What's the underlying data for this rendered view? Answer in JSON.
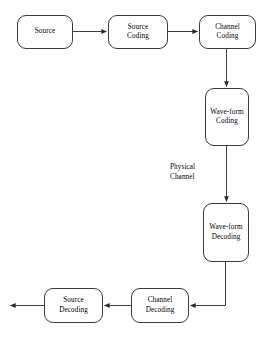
{
  "diagram": {
    "background_color": "#ffffff",
    "stroke_color": "#3a3a3a",
    "text_color": "#000000",
    "nodes": [
      {
        "id": "source",
        "lines": [
          "Source"
        ],
        "x": 17,
        "y": 15,
        "w": 56,
        "h": 34
      },
      {
        "id": "source-coding",
        "lines": [
          "Source",
          "Coding"
        ],
        "x": 108,
        "y": 15,
        "w": 60,
        "h": 34
      },
      {
        "id": "channel-coding",
        "lines": [
          "Channel",
          "Coding"
        ],
        "x": 199,
        "y": 15,
        "w": 57,
        "h": 34
      },
      {
        "id": "waveform-coding",
        "lines": [
          "Wave-form",
          "Coding"
        ],
        "x": 205,
        "y": 88,
        "w": 44,
        "h": 58
      },
      {
        "id": "waveform-decoding",
        "lines": [
          "Wave-form",
          "Decoding"
        ],
        "x": 203,
        "y": 203,
        "w": 46,
        "h": 59
      },
      {
        "id": "channel-decoding",
        "lines": [
          "Channel",
          "Decoding"
        ],
        "x": 131,
        "y": 288,
        "w": 58,
        "h": 35
      },
      {
        "id": "source-decoding",
        "lines": [
          "Source",
          "Decoding"
        ],
        "x": 44,
        "y": 288,
        "w": 59,
        "h": 35
      }
    ],
    "labels": [
      {
        "id": "physical-channel",
        "lines": [
          "Physical",
          "Channel"
        ],
        "x": 170,
        "y": 163
      }
    ],
    "connectors": [
      {
        "id": "source-to-source-coding",
        "from": "source",
        "to": "source-coding",
        "direction": "right"
      },
      {
        "id": "source-coding-to-channel-coding",
        "from": "source-coding",
        "to": "channel-coding",
        "direction": "right"
      },
      {
        "id": "channel-coding-to-waveform-coding",
        "from": "channel-coding",
        "to": "waveform-coding",
        "direction": "down"
      },
      {
        "id": "waveform-coding-to-waveform-decoding",
        "from": "waveform-coding",
        "to": "waveform-decoding",
        "direction": "down"
      },
      {
        "id": "waveform-decoding-to-channel-decoding",
        "from": "waveform-decoding",
        "to": "channel-decoding",
        "direction": "down-then-left"
      },
      {
        "id": "channel-decoding-to-source-decoding",
        "from": "channel-decoding",
        "to": "source-decoding",
        "direction": "left"
      },
      {
        "id": "source-decoding-output",
        "from": "source-decoding",
        "to": "output",
        "direction": "left"
      }
    ]
  }
}
